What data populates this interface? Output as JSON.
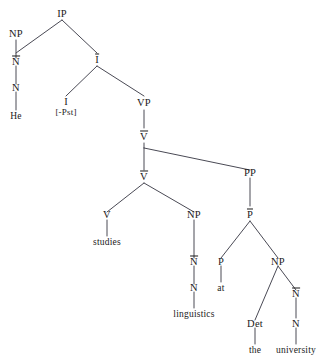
{
  "diagram": {
    "sentence": "He studies linguistics at the university",
    "background_color": "#ffffff",
    "line_color": "#4a4a55",
    "text_color": "#1a1a1a"
  },
  "nodes": {
    "ip": "IP",
    "np_subj": "NP",
    "nbar_subj": "N",
    "n_subj": "N",
    "word_he": "He",
    "ibar": "I",
    "i_head": "I",
    "i_feature": "[-Pst]",
    "vp": "VP",
    "vbar_upper": "V",
    "vbar_lower": "V",
    "v_head": "V",
    "word_studies": "studies",
    "np_obj": "NP",
    "nbar_obj": "N",
    "n_obj": "N",
    "word_linguistics": "linguistics",
    "pp": "PP",
    "pbar": "P",
    "p_head": "P",
    "word_at": "at",
    "np_pp": "NP",
    "det": "Det",
    "word_the": "the",
    "nbar_univ": "N",
    "n_univ": "N",
    "word_university": "university"
  }
}
